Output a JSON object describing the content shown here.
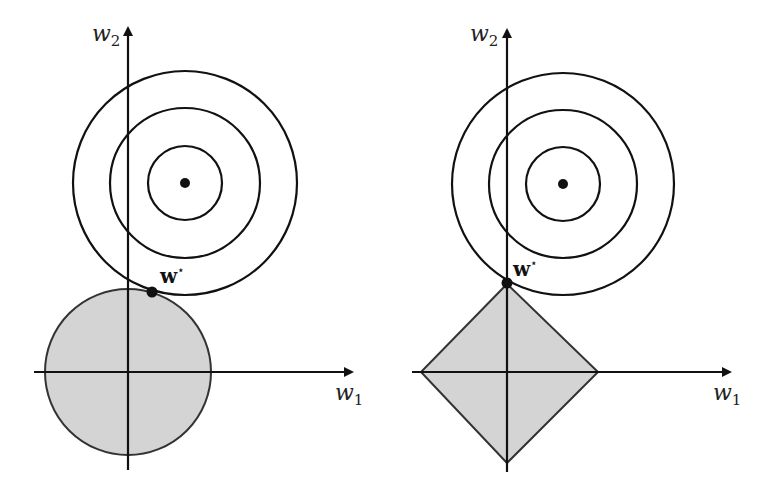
{
  "figure": {
    "colors": {
      "stroke": "#111111",
      "region_fill": "#d4d4d4",
      "region_stroke": "#333333",
      "background": "#ffffff"
    },
    "panels": [
      {
        "id": "left",
        "constraint": "l2-ball",
        "axis_x_label": {
          "base": "w",
          "sub": "1"
        },
        "axis_y_label": {
          "base": "w",
          "sub": "2"
        },
        "optimum_label": {
          "base": "w",
          "sup": "⋆"
        },
        "geometry": {
          "origin": [
            128,
            372
          ],
          "x_axis": [
            34,
            352
          ],
          "y_axis": [
            470,
            28
          ],
          "contour_center": [
            185,
            183
          ],
          "contour_radii": [
            37,
            75,
            112
          ],
          "ball_radius": 83,
          "optimum_point": [
            152,
            292
          ]
        }
      },
      {
        "id": "right",
        "constraint": "l1-diamond",
        "axis_x_label": {
          "base": "w",
          "sub": "1"
        },
        "axis_y_label": {
          "base": "w",
          "sub": "2"
        },
        "optimum_label": {
          "base": "w",
          "sup": "⋆"
        },
        "geometry": {
          "origin": [
            507,
            372
          ],
          "x_axis": [
            412,
            730
          ],
          "y_axis": [
            472,
            30
          ],
          "contour_center": [
            563,
            184
          ],
          "contour_radii": [
            37,
            74,
            111
          ],
          "diamond_vertices": [
            [
              507,
              284
            ],
            [
              598,
              372
            ],
            [
              507,
              463
            ],
            [
              421,
              372
            ]
          ],
          "optimum_point": [
            507,
            283
          ]
        }
      }
    ]
  }
}
